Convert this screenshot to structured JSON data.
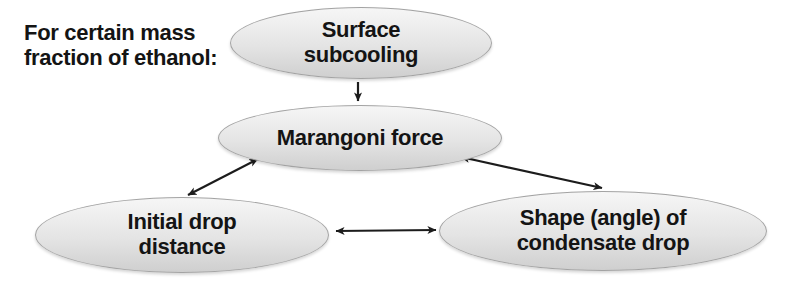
{
  "intro": {
    "text": "For certain mass fraction of ethanol:"
  },
  "diagram": {
    "nodes": [
      {
        "id": "surface-subcooling",
        "label": "Surface subcooling"
      },
      {
        "id": "marangoni-force",
        "label": "Marangoni force"
      },
      {
        "id": "initial-drop-distance",
        "label": "Initial drop distance"
      },
      {
        "id": "condensate-drop-shape",
        "label": "Shape (angle) of condensate drop"
      }
    ],
    "edges": [
      {
        "from": "surface-subcooling",
        "to": "marangoni-force",
        "type": "one-way"
      },
      {
        "from": "marangoni-force",
        "to": "initial-drop-distance",
        "type": "two-way"
      },
      {
        "from": "marangoni-force",
        "to": "condensate-drop-shape",
        "type": "two-way"
      },
      {
        "from": "initial-drop-distance",
        "to": "condensate-drop-shape",
        "type": "two-way"
      }
    ],
    "colors": {
      "node_fill_top": "#f6f6f6",
      "node_fill_mid": "#e4e4e4",
      "node_fill_bottom": "#cfcfcf",
      "node_border": "#a3a3a3",
      "arrow_color": "#1c1c1c",
      "text_color": "#141414",
      "bg_color": "#ffffff"
    }
  }
}
